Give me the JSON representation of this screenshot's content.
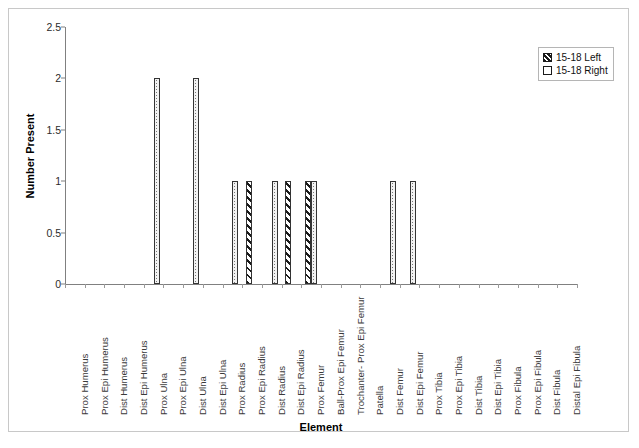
{
  "chart_data": {
    "type": "bar",
    "title": "",
    "xlabel": "Element",
    "ylabel": "Number Present",
    "ylim": [
      0,
      2.5
    ],
    "ytick_labels": [
      "0",
      "0.5",
      "1",
      "1.5",
      "2",
      "2.5"
    ],
    "ytick_values": [
      0,
      0.5,
      1,
      1.5,
      2,
      2.5
    ],
    "grid": false,
    "legend_position": "top-right",
    "categories": [
      "Prox Humerus",
      "Prox Epi Humerus",
      "Dist Humerus",
      "Dist Epi Humerus",
      "Prox Ulna",
      "Prox Epi Ulna",
      "Dist Ulna",
      "Dist Epi Ulna",
      "Prox Radius",
      "Prox Epi Radius",
      "Dist Radius",
      "Dist Epi Radius",
      "Prox Femur",
      "Ball-Prox Epi Femur",
      "Trochanter- Prox Epi Femur",
      "Patella",
      "Dist Femur",
      "Dist Epi Femur",
      "Prox Tibia",
      "Prox Epi Tibia",
      "Dist Tibia",
      "Dist Epi Tibia",
      "Prox Fibula",
      "Prox Epi Fibula",
      "Dist Fibula",
      "Distal Epi Fibula"
    ],
    "series": [
      {
        "name": "15-18 Left",
        "pattern": "hatched",
        "values": [
          0,
          0,
          0,
          0,
          0,
          0,
          0,
          0,
          0,
          1,
          0,
          1,
          1,
          0,
          0,
          0,
          0,
          0,
          0,
          0,
          0,
          0,
          0,
          0,
          0,
          0
        ]
      },
      {
        "name": "15-18 Right",
        "pattern": "dotted",
        "values": [
          0,
          0,
          0,
          0,
          2,
          0,
          2,
          0,
          1,
          0,
          1,
          0,
          1,
          0,
          0,
          0,
          1,
          1,
          0,
          0,
          0,
          0,
          0,
          0,
          0,
          0
        ]
      }
    ]
  },
  "legend": {
    "items": [
      {
        "label": "15-18 Left"
      },
      {
        "label": "15-18 Right"
      }
    ]
  }
}
